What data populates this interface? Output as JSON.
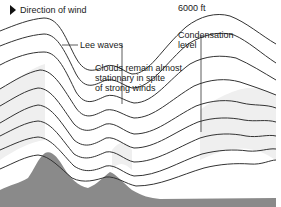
{
  "diagram": {
    "labels": {
      "direction": "Direction of wind",
      "lee_waves": "Lee waves",
      "condensation": "Condensation\nlevel",
      "clouds": "Clouds remain almost\nstationary in spite\nof strong winds",
      "altitude": "6000 ft"
    },
    "colors": {
      "line": "#333333",
      "terrain": "#8a8a8a",
      "cloud": "#ececec",
      "background": "#ffffff"
    }
  }
}
